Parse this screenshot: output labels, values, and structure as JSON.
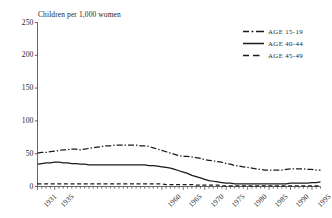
{
  "chart_data": {
    "type": "line",
    "title": "",
    "ylabel": "Children per 1,000 women",
    "xlabel": "",
    "ylim": [
      0,
      250
    ],
    "xlim": [
      1931,
      1997
    ],
    "grid": false,
    "legend_position": "top-right",
    "ytick_labels": [
      "250",
      "200",
      "150",
      "100",
      "50",
      "0"
    ],
    "ytick_values": [
      250,
      200,
      150,
      100,
      50,
      0
    ],
    "xtick_labels": [
      "1931",
      "1935",
      "1960",
      "1965",
      "1970",
      "1975",
      "1980",
      "1985",
      "1990",
      "1995"
    ],
    "xtick_values": [
      1931,
      1935,
      1960,
      1965,
      1970,
      1975,
      1980,
      1985,
      1990,
      1995
    ],
    "x": [
      1931,
      1932,
      1933,
      1934,
      1935,
      1936,
      1937,
      1938,
      1939,
      1940,
      1941,
      1942,
      1943,
      1944,
      1945,
      1946,
      1947,
      1948,
      1949,
      1950,
      1951,
      1952,
      1953,
      1954,
      1955,
      1956,
      1957,
      1958,
      1959,
      1960,
      1961,
      1962,
      1963,
      1964,
      1965,
      1966,
      1967,
      1968,
      1969,
      1970,
      1971,
      1972,
      1973,
      1974,
      1975,
      1976,
      1977,
      1978,
      1979,
      1980,
      1981,
      1982,
      1983,
      1984,
      1985,
      1986,
      1987,
      1988,
      1989,
      1990,
      1991,
      1992,
      1993,
      1994,
      1995,
      1996,
      1997
    ],
    "series": [
      {
        "name": "AGE 15-19",
        "style": "dash-dot",
        "color": "#1a1a1a",
        "values": [
          51,
          52,
          52,
          53,
          54,
          55,
          56,
          56,
          57,
          57,
          56,
          57,
          58,
          59,
          60,
          61,
          62,
          62,
          63,
          63,
          63,
          63,
          63,
          63,
          62,
          62,
          61,
          59,
          57,
          55,
          53,
          51,
          49,
          47,
          46,
          46,
          45,
          44,
          43,
          41,
          40,
          39,
          38,
          37,
          35,
          34,
          32,
          31,
          30,
          29,
          28,
          27,
          26,
          25,
          25,
          25,
          25,
          25,
          26,
          27,
          27,
          27,
          27,
          26,
          26,
          25,
          25
        ]
      },
      {
        "name": "AGE 40-44",
        "style": "solid",
        "color": "#1a1a1a",
        "values": [
          34,
          35,
          36,
          36,
          37,
          37,
          36,
          36,
          35,
          35,
          34,
          34,
          33,
          33,
          33,
          33,
          33,
          33,
          33,
          33,
          33,
          33,
          33,
          33,
          33,
          33,
          32,
          32,
          31,
          30,
          29,
          28,
          26,
          24,
          22,
          20,
          17,
          15,
          13,
          11,
          9,
          8,
          7,
          6,
          5,
          5,
          4,
          4,
          4,
          4,
          4,
          4,
          4,
          4,
          4,
          4,
          4,
          4,
          4,
          5,
          5,
          5,
          5,
          5,
          6,
          6,
          7
        ]
      },
      {
        "name": "AGE 45-49",
        "style": "dashed",
        "color": "#1a1a1a",
        "values": [
          4,
          4,
          4,
          4,
          4,
          4,
          4,
          4,
          4,
          4,
          4,
          4,
          4,
          4,
          4,
          4,
          4,
          4,
          4,
          4,
          4,
          4,
          4,
          4,
          4,
          4,
          4,
          4,
          4,
          4,
          3,
          3,
          3,
          3,
          3,
          3,
          3,
          2,
          2,
          2,
          2,
          2,
          2,
          1,
          1,
          1,
          1,
          1,
          1,
          1,
          1,
          1,
          1,
          1,
          1,
          1,
          1,
          1,
          1,
          1,
          1,
          1,
          1,
          1,
          1,
          1,
          1
        ]
      }
    ]
  },
  "legend": {
    "items": [
      {
        "label": "AGE 15-19",
        "style": "dash-dot"
      },
      {
        "label": "AGE 40-44",
        "style": "solid"
      },
      {
        "label": "AGE 45-49",
        "style": "dashed"
      }
    ]
  },
  "colors": {
    "ink": "#1a1a1a",
    "axis": "#555555",
    "background": "#ffffff"
  }
}
